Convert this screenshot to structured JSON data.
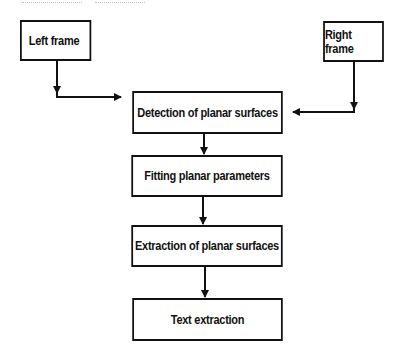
{
  "diagram": {
    "type": "flowchart",
    "inputs": [
      {
        "id": "left",
        "label": "Left frame"
      },
      {
        "id": "right",
        "label": "Right frame"
      }
    ],
    "steps": [
      {
        "id": "detect",
        "label": "Detection of planar surfaces"
      },
      {
        "id": "fit",
        "label": "Fitting planar parameters"
      },
      {
        "id": "extract",
        "label": "Extraction of planar surfaces"
      },
      {
        "id": "text",
        "label": "Text extraction"
      }
    ],
    "edges": [
      {
        "from": "left",
        "to": "detect"
      },
      {
        "from": "right",
        "to": "detect"
      },
      {
        "from": "detect",
        "to": "fit"
      },
      {
        "from": "fit",
        "to": "extract"
      },
      {
        "from": "extract",
        "to": "text"
      }
    ],
    "colors": {
      "stroke": "#111111",
      "fill": "#ffffff",
      "text": "#111111"
    }
  }
}
